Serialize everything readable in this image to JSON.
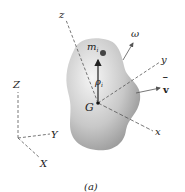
{
  "figure": {
    "caption": "(a)",
    "labels": {
      "body_axis_z": "z",
      "body_axis_y": "y",
      "body_axis_x": "x",
      "mass_particle": "m",
      "mass_subscript": "i",
      "position_vector": "ρ",
      "position_subscript": "i",
      "center_of_mass": "G",
      "angular_velocity": "ω",
      "velocity": "v",
      "velocity_bar": "‾",
      "fixed_axis_Z": "Z",
      "fixed_axis_Y": "Y",
      "fixed_axis_X": "X"
    },
    "colors": {
      "body_light": "#f4f4f4",
      "body_dark": "#8e8e8e",
      "lines": "#555555",
      "text": "#222222"
    }
  }
}
